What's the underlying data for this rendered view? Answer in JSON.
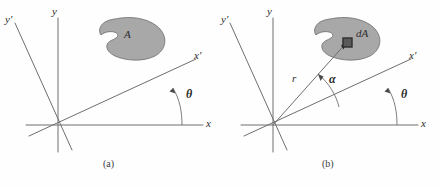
{
  "figure": {
    "kind": "technical-diagram",
    "background_color": "#fefefe",
    "line_color": "#6e6e6e",
    "blob_fill_color": "#a8a8a8",
    "blob_stroke_color": "#6b6b6b",
    "da_fill_color": "#5a5a5a",
    "da_stroke_color": "#2e2e2e",
    "text_color": "#2b2b2b"
  },
  "panels": [
    {
      "id": "a",
      "caption": "(a)",
      "labels": {
        "y_axis": "y",
        "y_prime_axis": "y′",
        "x_axis": "x",
        "x_prime_axis": "x′",
        "area": "A",
        "theta": "θ"
      }
    },
    {
      "id": "b",
      "caption": "(b)",
      "labels": {
        "y_axis": "y",
        "y_prime_axis": "y′",
        "x_axis": "x",
        "x_prime_axis": "x′",
        "differential_area": "dA",
        "radius": "r",
        "alpha": "α",
        "theta": "θ"
      }
    }
  ]
}
